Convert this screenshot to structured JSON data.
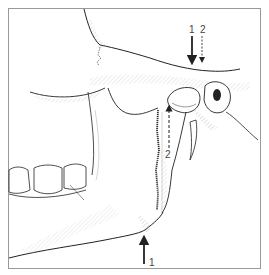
{
  "figure": {
    "labels": {
      "top_solid_arrow": "1",
      "top_dashed_arrow": "2",
      "ramus_dashed_arrow": "2",
      "bottom_solid_arrow": "1"
    },
    "colors": {
      "line": "#222222",
      "hatch": "#888888",
      "frame": "#999999",
      "background": "#ffffff"
    }
  }
}
